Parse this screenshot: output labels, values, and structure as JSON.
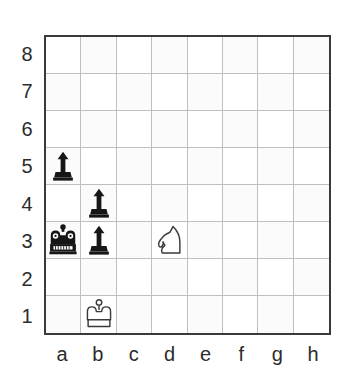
{
  "diagram": {
    "type": "chessboard",
    "orientation": "white-bottom",
    "colors": {
      "board_border": "#3a3a3a",
      "grid_line": "#bfbfbf",
      "light_square": "#ffffff",
      "shaded_square": "#fbfbfb",
      "black_piece": "#161616",
      "white_piece_outline": "#3a3a3a",
      "white_piece_fill": "#ffffff",
      "label_text": "#2c2c2c",
      "background": "#ffffff"
    },
    "rank_labels": [
      "8",
      "7",
      "6",
      "5",
      "4",
      "3",
      "2",
      "1"
    ],
    "file_labels": [
      "a",
      "b",
      "c",
      "d",
      "e",
      "f",
      "g",
      "h"
    ],
    "pieces": [
      {
        "square": "a5",
        "file": "a",
        "rank": "5",
        "color": "black",
        "type": "pawn",
        "icon": "black-pawn-icon"
      },
      {
        "square": "b4",
        "file": "b",
        "rank": "4",
        "color": "black",
        "type": "pawn",
        "icon": "black-pawn-icon"
      },
      {
        "square": "a3",
        "file": "a",
        "rank": "3",
        "color": "black",
        "type": "king",
        "icon": "black-king-icon"
      },
      {
        "square": "b3",
        "file": "b",
        "rank": "3",
        "color": "black",
        "type": "pawn",
        "icon": "black-pawn-icon"
      },
      {
        "square": "d3",
        "file": "d",
        "rank": "3",
        "color": "white",
        "type": "knight",
        "icon": "white-knight-icon"
      },
      {
        "square": "b1",
        "file": "b",
        "rank": "1",
        "color": "white",
        "type": "king",
        "icon": "white-king-icon"
      }
    ],
    "piece_count": {
      "black_pawns": "3",
      "black_kings": "1",
      "white_kings": "1",
      "white_knights": "1"
    }
  }
}
